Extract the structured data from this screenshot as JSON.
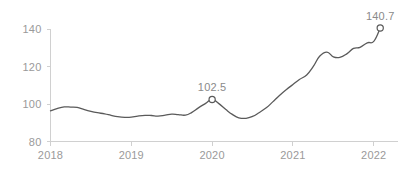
{
  "chart_data": {
    "type": "line",
    "title": "",
    "subtitle": "",
    "xlabel": "",
    "ylabel": "",
    "grid": false,
    "legend": "none",
    "xlim": [
      2018.0,
      2022.3
    ],
    "ylim": [
      80,
      145
    ],
    "y_ticks": [
      "80",
      "100",
      "120",
      "140"
    ],
    "y_tick_values": [
      80,
      100,
      120,
      140
    ],
    "x_ticks": [
      "2018",
      "2019",
      "2020",
      "2021",
      "2022"
    ],
    "x_tick_values": [
      2018,
      2019,
      2020,
      2021,
      2022
    ],
    "series": [
      {
        "name": "Index",
        "color": "#5a5a5a",
        "x": [
          2018.0,
          2018.08,
          2018.17,
          2018.25,
          2018.33,
          2018.42,
          2018.5,
          2018.58,
          2018.67,
          2018.75,
          2018.83,
          2018.92,
          2019.0,
          2019.08,
          2019.17,
          2019.25,
          2019.33,
          2019.42,
          2019.5,
          2019.58,
          2019.67,
          2019.75,
          2019.83,
          2019.92,
          2020.0,
          2020.08,
          2020.17,
          2020.25,
          2020.33,
          2020.42,
          2020.5,
          2020.58,
          2020.67,
          2020.75,
          2020.83,
          2020.92,
          2021.0,
          2021.08,
          2021.17,
          2021.25,
          2021.33,
          2021.42,
          2021.5,
          2021.58,
          2021.67,
          2021.75,
          2021.83,
          2021.92,
          2022.0,
          2022.08
        ],
        "values": [
          96.4,
          97.6,
          98.5,
          98.4,
          98.2,
          97.0,
          96.1,
          95.4,
          94.8,
          94.0,
          93.3,
          92.9,
          93.0,
          93.6,
          94.0,
          93.9,
          93.6,
          94.1,
          94.6,
          94.4,
          94.1,
          95.6,
          98.0,
          100.4,
          102.5,
          100.4,
          97.1,
          94.5,
          92.7,
          92.4,
          93.4,
          95.4,
          98.0,
          101.2,
          104.5,
          107.8,
          110.5,
          113.2,
          115.6,
          120.0,
          125.6,
          127.8,
          125.3,
          125.0,
          127.0,
          129.8,
          130.4,
          132.8,
          133.6,
          140.7
        ]
      }
    ],
    "annotations": [
      {
        "label": "102.5",
        "x": 2020.0,
        "y": 102.5,
        "marker": "open-circle"
      },
      {
        "label": "140.7",
        "x": 2022.08,
        "y": 140.7,
        "marker": "open-circle"
      }
    ],
    "colors": {
      "line": "#5a5a5a",
      "marker_stroke": "#5a5a5a",
      "marker_fill": "#ffffff",
      "axis": "#d0d0d0",
      "tick_label": "#9a9a9a",
      "annotation_label": "#8a8a8a",
      "background": "#ffffff"
    }
  }
}
